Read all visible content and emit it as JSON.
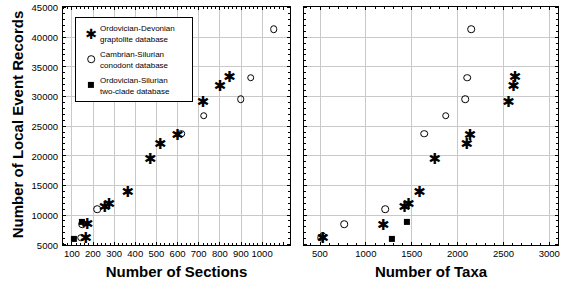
{
  "figure": {
    "ylabel": "Number of Local Event Records",
    "y_ticks": [
      5000,
      10000,
      15000,
      20000,
      25000,
      30000,
      35000,
      40000,
      45000
    ],
    "ylim": [
      5000,
      45000
    ]
  },
  "legend": {
    "entries": [
      {
        "symbol": "star",
        "label": "Ordovician-Devonian\ngraptolite database"
      },
      {
        "symbol": "circle",
        "label": "Cambrian-Silurian\nconodont database"
      },
      {
        "symbol": "square",
        "label": "Ordovician-Silurian\ntwo-clade database"
      }
    ]
  },
  "chart_data": [
    {
      "type": "scatter",
      "panel": "left",
      "title": "",
      "xlabel": "Number of Sections",
      "ylabel": "Number of Local Event Records",
      "xlim": [
        60,
        1130
      ],
      "ylim": [
        5000,
        45000
      ],
      "x_ticks": [
        100,
        200,
        300,
        400,
        500,
        600,
        700,
        800,
        900,
        1000
      ],
      "y_ticks": [
        5000,
        10000,
        15000,
        20000,
        25000,
        30000,
        35000,
        40000,
        45000
      ],
      "grid": true,
      "legend_position": "upper-left",
      "series": [
        {
          "name": "Ordovician-Devonian graptolite database",
          "symbol": "star",
          "points": [
            [
              168,
              6200
            ],
            [
              175,
              8500
            ],
            [
              258,
              11400
            ],
            [
              278,
              11900
            ],
            [
              367,
              13900
            ],
            [
              473,
              19600
            ],
            [
              520,
              22000
            ],
            [
              602,
              23600
            ],
            [
              723,
              29200
            ],
            [
              803,
              31900
            ],
            [
              848,
              33300
            ]
          ]
        },
        {
          "name": "Cambrian-Silurian conodont database",
          "symbol": "circle",
          "points": [
            [
              145,
              6100
            ],
            [
              152,
              8400
            ],
            [
              222,
              10900
            ],
            [
              620,
              23600
            ],
            [
              726,
              26700
            ],
            [
              900,
              29500
            ],
            [
              948,
              33100
            ],
            [
              1057,
              41300
            ]
          ]
        },
        {
          "name": "Ordovician-Silurian two-clade database",
          "symbol": "square",
          "points": [
            [
              110,
              5900
            ],
            [
              148,
              8700
            ]
          ]
        }
      ]
    },
    {
      "type": "scatter",
      "panel": "right",
      "title": "",
      "xlabel": "Number of Taxa",
      "ylabel": "Number of Local Event Records",
      "xlim": [
        330,
        3090
      ],
      "ylim": [
        5000,
        45000
      ],
      "x_ticks": [
        500,
        1000,
        1500,
        2000,
        2500,
        3000
      ],
      "y_ticks": [
        5000,
        10000,
        15000,
        20000,
        25000,
        30000,
        35000,
        40000,
        45000
      ],
      "grid": true,
      "legend_position": "none",
      "series": [
        {
          "name": "Ordovician-Devonian graptolite database",
          "symbol": "star",
          "points": [
            [
              535,
              6200
            ],
            [
              1195,
              8400
            ],
            [
              1425,
              11500
            ],
            [
              1470,
              11900
            ],
            [
              1590,
              13900
            ],
            [
              1755,
              19600
            ],
            [
              2105,
              22000
            ],
            [
              2140,
              23600
            ],
            [
              2560,
              29200
            ],
            [
              2615,
              31900
            ],
            [
              2630,
              33400
            ]
          ]
        },
        {
          "name": "Cambrian-Silurian conodont database",
          "symbol": "circle",
          "points": [
            [
              520,
              6100
            ],
            [
              535,
              6400
            ],
            [
              770,
              8400
            ],
            [
              1215,
              10900
            ],
            [
              1640,
              23600
            ],
            [
              1875,
              26700
            ],
            [
              2085,
              29500
            ],
            [
              2110,
              33100
            ],
            [
              2150,
              41300
            ]
          ]
        },
        {
          "name": "Ordovician-Silurian two-clade database",
          "symbol": "square",
          "points": [
            [
              1290,
              5900
            ],
            [
              1450,
              8700
            ]
          ]
        }
      ]
    }
  ]
}
